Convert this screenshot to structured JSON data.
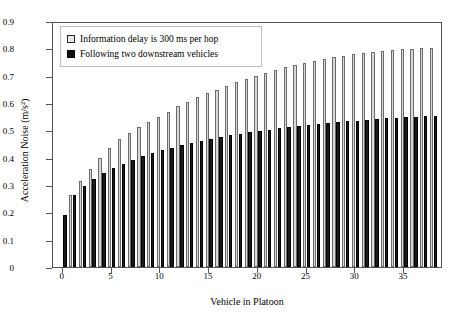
{
  "chart_data": {
    "type": "bar",
    "title": "",
    "xlabel": "Vehicle in Platoon",
    "ylabel": "Acceleration Noise (m/s²)",
    "xlim": [
      -1,
      39
    ],
    "ylim": [
      0,
      0.9
    ],
    "grid": false,
    "legend_position": "top-left",
    "xticks": [
      "0",
      "5",
      "10",
      "15",
      "20",
      "25",
      "30",
      "35"
    ],
    "xtick_values": [
      0,
      5,
      10,
      15,
      20,
      25,
      30,
      35
    ],
    "yticks": [
      "0",
      "0.1",
      "0.2",
      "0.3",
      "0.4",
      "0.5",
      "0.6",
      "0.7",
      "0.8",
      "0.9"
    ],
    "ytick_values": [
      0,
      0.1,
      0.2,
      0.3,
      0.4,
      0.5,
      0.6,
      0.7,
      0.8,
      0.9
    ],
    "categories": [
      0,
      1,
      2,
      3,
      4,
      5,
      6,
      7,
      8,
      9,
      10,
      11,
      12,
      13,
      14,
      15,
      16,
      17,
      18,
      19,
      20,
      21,
      22,
      23,
      24,
      25,
      26,
      27,
      28,
      29,
      30,
      31,
      32,
      33,
      34,
      35,
      36,
      37,
      38
    ],
    "series": [
      {
        "name": "Information delay is 300 ms per hop",
        "key_style": "open-square",
        "color": "#d8d8d8",
        "values": [
          null,
          0.265,
          0.315,
          0.36,
          0.4,
          0.435,
          0.467,
          0.49,
          0.512,
          0.532,
          0.55,
          0.568,
          0.59,
          0.605,
          0.622,
          0.636,
          0.648,
          0.662,
          0.676,
          0.688,
          0.7,
          0.71,
          0.72,
          0.73,
          0.738,
          0.747,
          0.754,
          0.761,
          0.767,
          0.773,
          0.778,
          0.783,
          0.787,
          0.791,
          0.794,
          0.797,
          0.799,
          0.801,
          0.803
        ]
      },
      {
        "name": "Following two downstream vehicles",
        "key_style": "filled-square",
        "color": "#1a1a1a",
        "values": [
          0.19,
          0.262,
          0.298,
          0.322,
          0.345,
          0.362,
          0.378,
          0.392,
          0.405,
          0.417,
          0.428,
          0.437,
          0.446,
          0.455,
          0.462,
          0.469,
          0.476,
          0.482,
          0.488,
          0.493,
          0.498,
          0.503,
          0.508,
          0.512,
          0.516,
          0.52,
          0.524,
          0.527,
          0.53,
          0.533,
          0.536,
          0.539,
          0.542,
          0.544,
          0.546,
          0.548,
          0.55,
          0.552,
          0.554
        ]
      }
    ]
  },
  "legend": {
    "items": [
      {
        "label": "Information delay is 300 ms per hop"
      },
      {
        "label": "Following two downstream vehicles"
      }
    ]
  }
}
